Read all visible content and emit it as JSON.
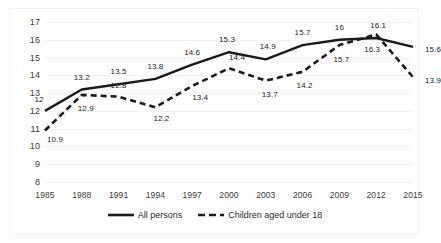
{
  "chart_data": {
    "type": "line",
    "title": "",
    "xlabel": "",
    "ylabel": "",
    "categories": [
      "1985",
      "1988",
      "1991",
      "1994",
      "1997",
      "2000",
      "2003",
      "2006",
      "2009",
      "2012",
      "2015"
    ],
    "ylim": [
      8,
      17
    ],
    "yticks": [
      "8",
      "9",
      "10",
      "11",
      "12",
      "13",
      "14",
      "15",
      "16",
      "17"
    ],
    "grid": true,
    "legend_position": "bottom",
    "series": [
      {
        "name": "All persons",
        "style": "solid",
        "color": "#1a1a1a",
        "values": [
          12,
          13.2,
          13.5,
          13.8,
          14.6,
          15.3,
          14.9,
          15.7,
          16,
          16.1,
          15.6
        ],
        "labels": [
          "12",
          "13.2",
          "13.5",
          "13.8",
          "14.6",
          "15.3",
          "14.9",
          "15.7",
          "16",
          "16.1",
          "15.6"
        ]
      },
      {
        "name": "Children aged under 18",
        "style": "dashed",
        "color": "#1a1a1a",
        "values": [
          10.9,
          12.9,
          12.8,
          12.2,
          13.4,
          14.4,
          13.7,
          14.2,
          15.7,
          16.3,
          13.9
        ],
        "labels": [
          "10.9",
          "12.9",
          "12.8",
          "12.2",
          "13.4",
          "14.4",
          "13.7",
          "14.2",
          "15.7",
          "16.3",
          "13.9"
        ]
      }
    ]
  },
  "legend": {
    "entries": [
      {
        "label": "All persons"
      },
      {
        "label": "Children aged under 18"
      }
    ]
  }
}
